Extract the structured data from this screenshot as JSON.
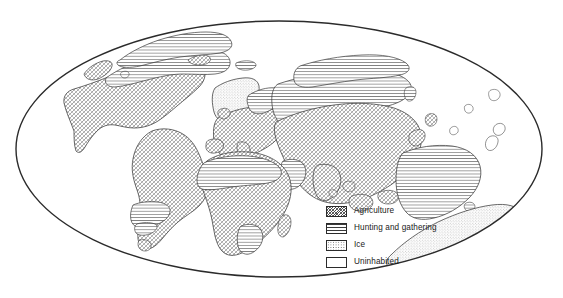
{
  "figure": {
    "type": "thematic-world-map",
    "projection": "elliptical (Mollweide-style)",
    "background_color": "#ffffff",
    "outline_color": "#2b2b2b"
  },
  "legend": {
    "position": "center-bottom-right, inside map frame",
    "items": [
      {
        "id": "agriculture",
        "label": "Agriculture",
        "pattern": "diagonal-crosshatch",
        "swatch_class": "sw-agriculture"
      },
      {
        "id": "hunting",
        "label": "Hunting and gathering",
        "pattern": "horizontal-lines",
        "swatch_class": "sw-hunting"
      },
      {
        "id": "ice",
        "label": "Ice",
        "pattern": "stipple-dots",
        "swatch_class": "sw-ice"
      },
      {
        "id": "uninhabited",
        "label": "Uninhabited",
        "pattern": "blank-white",
        "swatch_class": "sw-uninhabited"
      }
    ]
  },
  "map_regions": [
    {
      "name": "North America",
      "category": "agriculture"
    },
    {
      "name": "Northern North America",
      "category": "hunting"
    },
    {
      "name": "Greenland",
      "category": "ice"
    },
    {
      "name": "South America",
      "category": "agriculture"
    },
    {
      "name": "Patagonia",
      "category": "hunting"
    },
    {
      "name": "Europe",
      "category": "agriculture"
    },
    {
      "name": "Northern Scandinavia",
      "category": "hunting"
    },
    {
      "name": "Africa",
      "category": "agriculture"
    },
    {
      "name": "Sahara",
      "category": "hunting"
    },
    {
      "name": "Southern Africa",
      "category": "hunting"
    },
    {
      "name": "Asia",
      "category": "agriculture"
    },
    {
      "name": "Siberia",
      "category": "hunting"
    },
    {
      "name": "Arabian Peninsula",
      "category": "hunting"
    },
    {
      "name": "Australia",
      "category": "hunting"
    },
    {
      "name": "New Guinea",
      "category": "agriculture"
    },
    {
      "name": "Antarctica",
      "category": "ice"
    },
    {
      "name": "Ocean",
      "category": "uninhabited"
    }
  ]
}
